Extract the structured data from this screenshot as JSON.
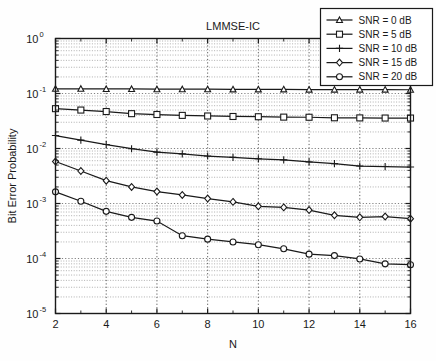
{
  "chart_data": {
    "type": "line",
    "title": "LMMSE-IC",
    "xlabel": "N",
    "ylabel": "Bit Error Probability",
    "xscale": "linear",
    "yscale": "log",
    "xlim": [
      2,
      16
    ],
    "ylim": [
      1e-05,
      1
    ],
    "grid": true,
    "legend_position": "upper right",
    "x": [
      2,
      3,
      4,
      5,
      6,
      7,
      8,
      9,
      10,
      11,
      12,
      13,
      14,
      15,
      16
    ],
    "xticks": [
      2,
      4,
      6,
      8,
      10,
      12,
      14,
      16
    ],
    "xticklabels": [
      "2",
      "4",
      "6",
      "8",
      "10",
      "12",
      "14",
      "16"
    ],
    "yticks": [
      1e-05,
      0.0001,
      0.001,
      0.01,
      0.1,
      1
    ],
    "yticklabels": [
      "10-5",
      "10-4",
      "10-3",
      "10-2",
      "10-1",
      "100"
    ],
    "series": [
      {
        "name": "SNR = 0 dB",
        "marker": "triangle",
        "values": [
          0.122,
          0.122,
          0.121,
          0.121,
          0.12,
          0.12,
          0.12,
          0.119,
          0.119,
          0.119,
          0.118,
          0.118,
          0.118,
          0.118,
          0.117
        ]
      },
      {
        "name": "SNR = 5 dB",
        "marker": "square",
        "values": [
          0.053,
          0.05,
          0.047,
          0.043,
          0.0415,
          0.04,
          0.039,
          0.0382,
          0.0378,
          0.0372,
          0.037,
          0.0362,
          0.036,
          0.0358,
          0.0358
        ]
      },
      {
        "name": "SNR = 10 dB",
        "marker": "plus",
        "values": [
          0.0172,
          0.0142,
          0.0118,
          0.0099,
          0.0086,
          0.008,
          0.0073,
          0.0069,
          0.0065,
          0.0062,
          0.0057,
          0.0053,
          0.0048,
          0.0047,
          0.0046
        ]
      },
      {
        "name": "SNR = 15 dB",
        "marker": "diamond",
        "values": [
          0.0058,
          0.0039,
          0.0026,
          0.002,
          0.00165,
          0.00143,
          0.00123,
          0.00107,
          0.00089,
          0.00085,
          0.00076,
          0.00061,
          0.00056,
          0.00058,
          0.00053
        ]
      },
      {
        "name": "SNR = 20 dB",
        "marker": "circle",
        "values": [
          0.00163,
          0.0011,
          0.00072,
          0.00056,
          0.00048,
          0.00026,
          0.000225,
          0.0002,
          0.000178,
          0.00015,
          0.00012,
          0.000113,
          9.8e-05,
          8e-05,
          7.7e-05
        ]
      }
    ]
  },
  "legend": {
    "entries": [
      "SNR = 0 dB",
      "SNR = 5 dB",
      "SNR = 10 dB",
      "SNR = 15 dB",
      "SNR = 20 dB"
    ]
  },
  "colors": {
    "foreground": "#1a1a1a",
    "background": "#ffffff",
    "grid_major": "#6a6a6a",
    "grid_minor": "#8e8e8e"
  }
}
